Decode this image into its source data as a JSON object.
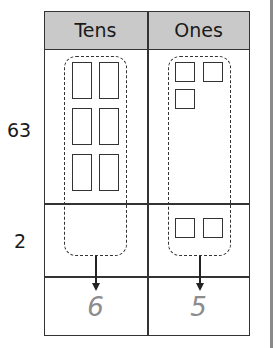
{
  "table": {
    "headers": [
      "Tens",
      "Ones"
    ],
    "rows": [
      {
        "label": "63",
        "tens_blocks": 6,
        "ones_blocks": 3
      },
      {
        "label": "2",
        "tens_blocks": 0,
        "ones_blocks": 2
      }
    ],
    "result": {
      "tens": "6",
      "ones": "5"
    }
  },
  "colors": {
    "header_fill": "#c9c9c9",
    "line": "#333333",
    "answer_text": "#8c8c8c"
  }
}
